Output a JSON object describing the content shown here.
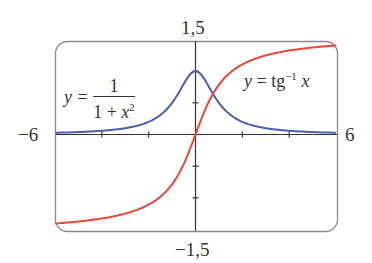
{
  "chart_data": {
    "type": "line",
    "title": "",
    "xlabel": "",
    "ylabel": "",
    "xlim": [
      -6,
      6
    ],
    "ylim": [
      -1.5,
      1.5
    ],
    "x_tick_labels": [
      "-6",
      "6"
    ],
    "y_tick_labels": [
      "1,5",
      "-1,5"
    ],
    "x_ticks": [
      -4,
      -2,
      2,
      4
    ],
    "y_ticks": [
      -1,
      -0.5,
      0.5,
      1
    ],
    "grid": false,
    "series": [
      {
        "name": "y = 1/(1+x^2)",
        "color": "#4a5fae",
        "x": [
          -6,
          -5,
          -4,
          -3,
          -2,
          -1.5,
          -1,
          -0.5,
          0,
          0.5,
          1,
          1.5,
          2,
          3,
          4,
          5,
          6
        ],
        "y": [
          0.027,
          0.038,
          0.059,
          0.1,
          0.2,
          0.308,
          0.5,
          0.8,
          1,
          0.8,
          0.5,
          0.308,
          0.2,
          0.1,
          0.059,
          0.038,
          0.027
        ]
      },
      {
        "name": "y = tg^-1 x",
        "color": "#e8473a",
        "x": [
          -6,
          -5,
          -4,
          -3,
          -2,
          -1.5,
          -1,
          -0.5,
          0,
          0.5,
          1,
          1.5,
          2,
          3,
          4,
          5,
          6
        ],
        "y": [
          -1.406,
          -1.373,
          -1.326,
          -1.249,
          -1.107,
          -0.983,
          -0.785,
          -0.464,
          0,
          0.464,
          0.785,
          0.983,
          1.107,
          1.249,
          1.326,
          1.373,
          1.406
        ]
      }
    ]
  },
  "labels": {
    "y_top": "1,5",
    "y_bottom": "−1,5",
    "x_left": "−6",
    "x_right": "6",
    "eq1_lhs": "y =",
    "eq1_num": "1",
    "eq1_den_pre": "1 + ",
    "eq1_den_var": "x",
    "eq1_den_exp": "2",
    "eq2_var": "y",
    "eq2_mid": " = tg",
    "eq2_exp": "−1",
    "eq2_arg": " x"
  }
}
